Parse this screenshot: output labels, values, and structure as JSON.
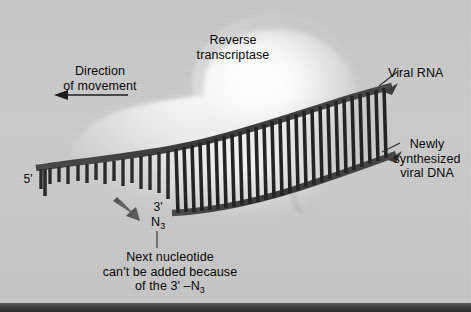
{
  "figure": {
    "background_color": "#c8c8c8",
    "border_color": "#3a3a3a"
  },
  "enzyme": {
    "name": "reverse-transcriptase",
    "label": "Reverse\ntranscriptase",
    "fill_color": "#e3e3e3",
    "highlight_color": "#ffffff"
  },
  "annotations": {
    "direction": {
      "label": "Direction\nof movement",
      "arrow_direction": "left"
    },
    "viral_rna": {
      "label": "Viral RNA",
      "strand": "template"
    },
    "new_dna": {
      "label": "Newly\nsynthesized\nviral DNA",
      "strand": "nascent"
    },
    "five_prime": {
      "label": "5'"
    },
    "three_prime": {
      "label": "3'"
    },
    "azido_group": {
      "label": "N",
      "subscript": "3"
    },
    "caption": {
      "line1": "Next nucleotide",
      "line2": "can't be added because",
      "line3_prefix": "of the 3' –N",
      "line3_subscript": "3"
    }
  },
  "strands": {
    "rail_color": "#3c3c3c",
    "rung_color": "#2a2a2a",
    "paired_rung_count": 30,
    "unpaired_rung_count": 13,
    "arrow_color": "#4a4a4a"
  }
}
